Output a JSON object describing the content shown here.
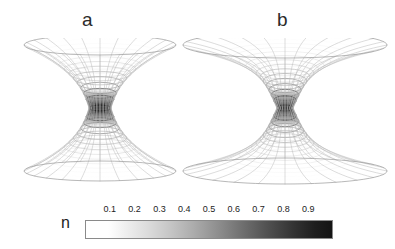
{
  "figure": {
    "background_color": "#ffffff",
    "panels": [
      {
        "id": "a",
        "label": "a",
        "surface_type": "hyperboloid-wireframe",
        "description": "narrow funnel-shaped hyperboloid of one sheet, wireframe mesh shaded by n",
        "geometry": {
          "center_x": 100,
          "waist_y": 108,
          "rim_half_width": 76,
          "waist_half_width": 11,
          "half_height": 63,
          "rim_ellipse_ry": 10,
          "waist_ellipse_ry": 3,
          "meridians": 24,
          "parallels": 13,
          "flare_exponent": 2.6
        }
      },
      {
        "id": "b",
        "label": "b",
        "surface_type": "hyperboloid-wireframe",
        "description": "wide flat funnel-shaped hyperboloid of one sheet, wireframe mesh shaded by n",
        "geometry": {
          "center_x": 285,
          "waist_y": 108,
          "rim_half_width": 102,
          "waist_half_width": 8,
          "half_height": 63,
          "rim_ellipse_ry": 13,
          "waist_ellipse_ry": 3,
          "meridians": 24,
          "parallels": 15,
          "flare_exponent": 4.2
        }
      }
    ]
  },
  "colorbar": {
    "title": "n",
    "orientation": "horizontal",
    "label_position": "above",
    "colormap": "grayscale-reversed",
    "min_color": "#ffffff",
    "max_color": "#141414",
    "range": [
      0.0,
      1.0
    ],
    "ticks": [
      {
        "value": 0.1,
        "label": "0.1"
      },
      {
        "value": 0.2,
        "label": "0.2"
      },
      {
        "value": 0.3,
        "label": "0.3"
      },
      {
        "value": 0.4,
        "label": "0.4"
      },
      {
        "value": 0.5,
        "label": "0.5"
      },
      {
        "value": 0.6,
        "label": "0.6"
      },
      {
        "value": 0.7,
        "label": "0.7"
      },
      {
        "value": 0.8,
        "label": "0.8"
      },
      {
        "value": 0.9,
        "label": "0.9"
      }
    ]
  },
  "chart_data": {
    "type": "surface",
    "title": "",
    "subtitle": "",
    "xlabel": "",
    "ylabel": "",
    "legend_position": "bottom",
    "grid": false,
    "colorbar_label": "n",
    "colorbar_range": [
      0.0,
      1.0
    ],
    "colorbar_ticks": [
      0.1,
      0.2,
      0.3,
      0.4,
      0.5,
      0.6,
      0.7,
      0.8,
      0.9
    ],
    "colormap": "gray_r",
    "panels": [
      {
        "name": "a",
        "surface": "hyperboloid of one sheet (wormhole throat)",
        "throat_radius_rel": 0.145,
        "rim_radius_rel": 1.0,
        "aspect_height_to_rim": 0.83,
        "n_at_throat": 0.85,
        "n_at_rim": 0.05,
        "n_profile": "monotonically decreasing from throat to rim"
      },
      {
        "name": "b",
        "surface": "hyperboloid of one sheet (wormhole throat)",
        "throat_radius_rel": 0.078,
        "rim_radius_rel": 1.0,
        "aspect_height_to_rim": 0.62,
        "n_at_throat": 0.95,
        "n_at_rim": 0.03,
        "n_profile": "monotonically decreasing from throat to rim"
      }
    ]
  }
}
